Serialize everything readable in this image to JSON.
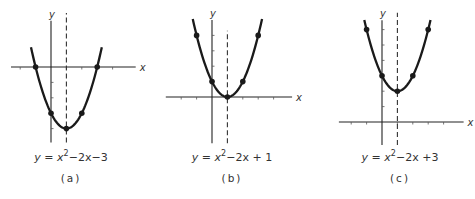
{
  "chart_data": [
    {
      "type": "line",
      "caption": "(a)",
      "equation": {
        "lhs": "y",
        "rhs_prefix": "x",
        "exponent": "2",
        "rhs_suffix": "−2x−3"
      },
      "equation_text": "y = x²−2x−3",
      "x_label": "x",
      "y_label": "y",
      "axis_of_symmetry": 1,
      "vertex": [
        1,
        -4
      ],
      "marked_points": [
        [
          -1,
          0
        ],
        [
          0,
          -3
        ],
        [
          1,
          -4
        ],
        [
          2,
          -3
        ],
        [
          3,
          0
        ]
      ],
      "coeffs": {
        "a": 1,
        "b": -2,
        "c": -3
      },
      "x_range": [
        -1.3,
        3.3
      ],
      "grid": false,
      "layout": {
        "origin": [
          51,
          67
        ],
        "unit": 15.4,
        "xaxis": [
          -2.6,
          5.5
        ],
        "yaxis": [
          -4.9,
          3.0
        ],
        "dash": [
          -4.9,
          3.5
        ],
        "tick_x": [
          -2,
          -1,
          1,
          2,
          3,
          4
        ],
        "tick_y": [
          -1,
          -2,
          -3,
          -4
        ]
      }
    },
    {
      "type": "line",
      "caption": "(b)",
      "equation": {
        "lhs": "y",
        "rhs_prefix": "x",
        "exponent": "2",
        "rhs_suffix": "−2x + 1"
      },
      "equation_text": "y = x²−2x+1",
      "x_label": "x",
      "y_label": "y",
      "axis_of_symmetry": 1,
      "vertex": [
        1,
        0
      ],
      "marked_points": [
        [
          -1,
          4
        ],
        [
          0,
          1
        ],
        [
          1,
          0
        ],
        [
          2,
          1
        ],
        [
          3,
          4
        ]
      ],
      "coeffs": {
        "a": 1,
        "b": -2,
        "c": 1
      },
      "x_range": [
        -1.25,
        3.25
      ],
      "grid": false,
      "layout": {
        "origin": [
          212,
          97
        ],
        "unit": 15.4,
        "xaxis": [
          -3.0,
          5.2
        ],
        "yaxis": [
          -3.0,
          5.0
        ],
        "dash": [
          -3.0,
          4.3
        ],
        "tick_x": [
          -2,
          -1,
          1,
          2,
          3,
          4
        ],
        "tick_y": [
          1,
          2,
          3,
          4
        ]
      }
    },
    {
      "type": "line",
      "caption": "(c)",
      "equation": {
        "lhs": "y",
        "rhs_prefix": "x",
        "exponent": "2",
        "rhs_suffix": "−2x +3"
      },
      "equation_text": "y = x²−2x+3",
      "x_label": "x",
      "y_label": "y",
      "axis_of_symmetry": 1,
      "vertex": [
        1,
        2
      ],
      "marked_points": [
        [
          -1,
          6
        ],
        [
          0,
          3
        ],
        [
          1,
          2
        ],
        [
          2,
          3
        ],
        [
          3,
          6
        ]
      ],
      "coeffs": {
        "a": 1,
        "b": -2,
        "c": 3
      },
      "x_range": [
        -1.15,
        3.15
      ],
      "grid": false,
      "layout": {
        "origin": [
          382,
          122
        ],
        "unit": 15.4,
        "xaxis": [
          -2.8,
          5.3
        ],
        "yaxis": [
          -1.5,
          6.6
        ],
        "dash": [
          -1.5,
          7.1
        ],
        "tick_x": [
          -2,
          -1,
          1,
          2,
          3,
          4
        ],
        "tick_y": [
          1,
          2,
          3,
          4,
          5,
          6
        ]
      }
    }
  ],
  "figure": {
    "panels": [
      {
        "caption": "(a)",
        "eq_y": "y",
        "eq_eq": " = ",
        "eq_x": "x",
        "eq_exp": "2",
        "eq_rest": "−2x−3"
      },
      {
        "caption": "(b)",
        "eq_y": "y",
        "eq_eq": " = ",
        "eq_x": "x",
        "eq_exp": "2",
        "eq_rest": "−2x + 1"
      },
      {
        "caption": "(c)",
        "eq_y": "y",
        "eq_eq": " = ",
        "eq_x": "x",
        "eq_exp": "2",
        "eq_rest": "−2x +3"
      }
    ]
  }
}
